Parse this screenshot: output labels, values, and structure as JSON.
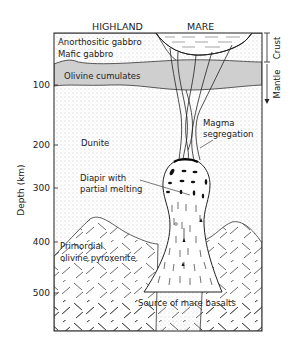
{
  "header": {
    "left_region": "HIGHLAND",
    "right_region": "MARE"
  },
  "axis": {
    "label": "Depth (km)",
    "ticks": [
      "100",
      "200",
      "300",
      "400",
      "500"
    ]
  },
  "side_labels": {
    "crust": "Crust",
    "mantle": "Mantle"
  },
  "layers": {
    "anorthositic": "Anorthositic gabbro",
    "mafic": "Mafic gabbro",
    "olivine_cumulates": "Olivine cumulates",
    "dunite": "Dunite",
    "primordial_1": "Primordial",
    "primordial_2": "olivine pyroxenite"
  },
  "annotations": {
    "magma_1": "Magma",
    "magma_2": "segregation",
    "diapir_1": "Diapir with",
    "diapir_2": "partial melting",
    "source": "Source of mare basalts"
  },
  "colors": {
    "olivine_band": "#cfcfcf",
    "line": "#222222"
  }
}
